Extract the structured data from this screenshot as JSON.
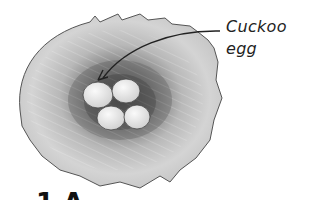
{
  "figure": {
    "eggs": [
      {
        "id": "cuckoo",
        "label": "Cuckoo egg"
      },
      {
        "id": "host-1"
      },
      {
        "id": "host-2"
      },
      {
        "id": "host-3"
      }
    ],
    "annotation": {
      "line1": "Cuckoo",
      "line2": "egg"
    },
    "bottom_caption_partial": "1 A"
  },
  "colors": {
    "nest_outer": "#bdbdbd",
    "nest_inner_dark": "#6e6e6e",
    "egg_fill": "#ececec",
    "outline": "#333333",
    "text": "#222222"
  }
}
